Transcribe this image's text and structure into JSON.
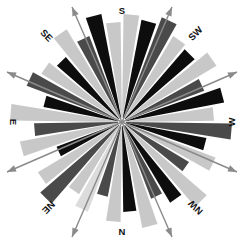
{
  "figure": {
    "name": "wind-rose-diagram",
    "background_color": "#ffffff",
    "center": {
      "x": 122,
      "y": 122
    },
    "hub_radius": 4,
    "hub_color": "#ffffff"
  },
  "compass": {
    "labels": [
      {
        "id": "s",
        "text": "S",
        "x": 122,
        "y": 11,
        "rotation": 0
      },
      {
        "id": "sw",
        "text": "SW",
        "x": 196,
        "y": 34,
        "rotation": -45
      },
      {
        "id": "w",
        "text": "W",
        "x": 232,
        "y": 122,
        "rotation": -90
      },
      {
        "id": "nw",
        "text": "NW",
        "x": 196,
        "y": 207,
        "rotation": -135
      },
      {
        "id": "n",
        "text": "N",
        "x": 122,
        "y": 232,
        "rotation": 0
      },
      {
        "id": "ne",
        "text": "NE",
        "x": 48,
        "y": 207,
        "rotation": 135
      },
      {
        "id": "e",
        "text": "E",
        "x": 13,
        "y": 122,
        "rotation": 90
      },
      {
        "id": "se",
        "text": "SE",
        "x": 46,
        "y": 36,
        "rotation": 45
      }
    ]
  },
  "axes": {
    "color": "#8a8a8a",
    "lines": [
      {
        "id": "axis-vertical-left",
        "x1": 72,
        "y1": 7,
        "x2": 172,
        "y2": 237
      },
      {
        "id": "axis-vertical-right",
        "x1": 172,
        "y1": 7,
        "x2": 72,
        "y2": 237
      },
      {
        "id": "axis-horizontal-up",
        "x1": 7,
        "y1": 72,
        "x2": 237,
        "y2": 172
      },
      {
        "id": "axis-horizontal-dn",
        "x1": 7,
        "y1": 172,
        "x2": 237,
        "y2": 72
      }
    ]
  },
  "chart_data": {
    "type": "pie",
    "title": "",
    "subtitle": "",
    "xlabel": "",
    "ylabel": "",
    "legend_position": "none",
    "grid": false,
    "chart_subtype": "wind-rose / polar rose diagram",
    "direction_labels": [
      "S",
      "SW",
      "W",
      "NW",
      "N",
      "NE",
      "E",
      "SE"
    ],
    "sector_count": 36,
    "angle_step_deg": 10,
    "rmax": 112,
    "palette": {
      "black": "#0d0d0d",
      "dark_gray": "#4a4a4a",
      "mid_gray": "#808080",
      "light_gray": "#c8c8c8",
      "pale_gray": "#dcdcdc"
    },
    "categories": [
      "0",
      "10",
      "20",
      "30",
      "40",
      "50",
      "60",
      "70",
      "80",
      "90",
      "100",
      "110",
      "120",
      "130",
      "140",
      "150",
      "160",
      "170",
      "180",
      "190",
      "200",
      "210",
      "220",
      "230",
      "240",
      "250",
      "260",
      "270",
      "280",
      "290",
      "300",
      "310",
      "320",
      "330",
      "340",
      "350"
    ],
    "values": [
      108,
      104,
      112,
      100,
      96,
      110,
      88,
      104,
      92,
      110,
      86,
      100,
      78,
      112,
      94,
      82,
      108,
      90,
      100,
      76,
      96,
      84,
      108,
      98,
      70,
      104,
      88,
      112,
      80,
      102,
      94,
      86,
      108,
      92,
      110,
      100
    ],
    "colors": [
      "#c8c8c8",
      "#0d0d0d",
      "#4a4a4a",
      "#c8c8c8",
      "#0d0d0d",
      "#c8c8c8",
      "#4a4a4a",
      "#0d0d0d",
      "#c8c8c8",
      "#4a4a4a",
      "#0d0d0d",
      "#c8c8c8",
      "#4a4a4a",
      "#c8c8c8",
      "#0d0d0d",
      "#4a4a4a",
      "#c8c8c8",
      "#0d0d0d",
      "#c8c8c8",
      "#4a4a4a",
      "#dcdcdc",
      "#c8c8c8",
      "#4a4a4a",
      "#c8c8c8",
      "#0d0d0d",
      "#c8c8c8",
      "#4a4a4a",
      "#c8c8c8",
      "#0d0d0d",
      "#4a4a4a",
      "#c8c8c8",
      "#0d0d0d",
      "#c8c8c8",
      "#4a4a4a",
      "#0d0d0d",
      "#c8c8c8"
    ]
  }
}
